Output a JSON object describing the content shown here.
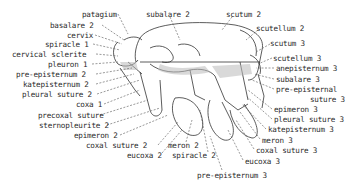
{
  "diagram": {
    "labels_left": [
      {
        "id": "patagium",
        "text": "patagium",
        "x": 82,
        "y": 11
      },
      {
        "id": "basalare_2",
        "text": "basalare 2",
        "x": 50,
        "y": 22
      },
      {
        "id": "cervix",
        "text": "cervix",
        "x": 67,
        "y": 32
      },
      {
        "id": "spiracle_1",
        "text": "spiracle 1",
        "x": 45,
        "y": 41
      },
      {
        "id": "cervical_sclerite",
        "text": "cervical sclerite",
        "x": 12,
        "y": 51
      },
      {
        "id": "pleuron_1",
        "text": "pleuron 1",
        "x": 48,
        "y": 61
      },
      {
        "id": "pre_episternum_2",
        "text": "pre-episternum 2",
        "x": 16,
        "y": 71
      },
      {
        "id": "katepisternum_2",
        "text": "katepisternum 2",
        "x": 23,
        "y": 81
      },
      {
        "id": "pleural_suture_2",
        "text": "pleural suture 2",
        "x": 22,
        "y": 91
      },
      {
        "id": "coxa_1",
        "text": "coxa 1",
        "x": 76,
        "y": 101
      },
      {
        "id": "precoxal_suture",
        "text": "precoxal suture",
        "x": 38,
        "y": 112
      },
      {
        "id": "sternopleurite_2",
        "text": "sternopleurite 2",
        "x": 39,
        "y": 122
      },
      {
        "id": "epimeron_2",
        "text": "epimeron 2",
        "x": 74,
        "y": 132
      },
      {
        "id": "coxal_suture_2",
        "text": "coxal suture 2",
        "x": 86,
        "y": 142
      },
      {
        "id": "eucoxa_2",
        "text": "eucoxa 2",
        "x": 127,
        "y": 152
      },
      {
        "id": "meron_2",
        "text": "meron 2",
        "x": 168,
        "y": 142
      },
      {
        "id": "spiracle_2",
        "text": "spiracle 2",
        "x": 172,
        "y": 152
      }
    ],
    "labels_top": [
      {
        "id": "subalare_2",
        "text": "subalare 2",
        "x": 146,
        "y": 11
      },
      {
        "id": "scutum_2",
        "text": "scutum 2",
        "x": 226,
        "y": 11
      }
    ],
    "labels_right": [
      {
        "id": "scutellum_2",
        "text": "scutellum 2",
        "x": 256,
        "y": 25
      },
      {
        "id": "scutum_3",
        "text": "scutum 3",
        "x": 270,
        "y": 40
      },
      {
        "id": "scutellum_3",
        "text": "scutellum 3",
        "x": 273,
        "y": 55
      },
      {
        "id": "anepisternum_3",
        "text": "anepisternum 3",
        "x": 276,
        "y": 65
      },
      {
        "id": "subalare_3",
        "text": "subalare 3",
        "x": 276,
        "y": 76
      },
      {
        "id": "pre_episternal_suture_3_line1",
        "text": "pre-episternal",
        "x": 276,
        "y": 86
      },
      {
        "id": "pre_episternal_suture_3_line2",
        "text": "suture 3",
        "x": 310,
        "y": 96
      },
      {
        "id": "epimeron_3",
        "text": "epimeron 3",
        "x": 274,
        "y": 106
      },
      {
        "id": "pleural_suture_3",
        "text": "pleural suture 3",
        "x": 274,
        "y": 116
      },
      {
        "id": "katepisternum_3",
        "text": "katepisternum 3",
        "x": 268,
        "y": 126
      },
      {
        "id": "meron_3",
        "text": "meron 3",
        "x": 262,
        "y": 137
      },
      {
        "id": "coxal_suture_3",
        "text": "coxal suture 3",
        "x": 256,
        "y": 147
      },
      {
        "id": "eucoxa_3",
        "text": "eucoxa 3",
        "x": 245,
        "y": 158
      }
    ],
    "labels_bottom": [
      {
        "id": "pre_episternum_3",
        "text": "pre-episternum 3",
        "x": 197,
        "y": 172
      }
    ]
  }
}
